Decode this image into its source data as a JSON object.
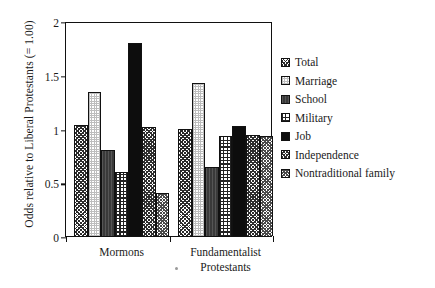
{
  "chart_data": {
    "type": "bar",
    "title": "",
    "xlabel": "",
    "ylabel": "Odds relative to Liberal Protestants (= 1.00)",
    "ylim": [
      0,
      2
    ],
    "yticks": [
      "0",
      "0.5",
      "1",
      "1.5",
      "2"
    ],
    "ytick_values": [
      0,
      0.5,
      1,
      1.5,
      2
    ],
    "grid": false,
    "legend_position": "right",
    "categories": [
      "Mormons",
      "Fundamentalist\nProtestants"
    ],
    "category_labels": [
      "Mormons",
      "Fundamentalist Protestants"
    ],
    "series": [
      {
        "name": "Total",
        "values": [
          1.03,
          1.0
        ],
        "swatch": "p-total"
      },
      {
        "name": "Marriage",
        "values": [
          1.34,
          1.42
        ],
        "swatch": "p-marriage"
      },
      {
        "name": "School",
        "values": [
          0.8,
          0.64
        ],
        "swatch": "p-school"
      },
      {
        "name": "Military",
        "values": [
          0.6,
          0.93
        ],
        "swatch": "p-military"
      },
      {
        "name": "Job",
        "values": [
          1.8,
          1.02
        ],
        "swatch": "p-job"
      },
      {
        "name": "Independence",
        "values": [
          1.01,
          0.94
        ],
        "swatch": "p-independence"
      },
      {
        "name": "Nontraditional family",
        "values": [
          0.4,
          0.93
        ],
        "swatch": "p-nontrad"
      }
    ]
  },
  "legend": {
    "items": [
      {
        "label": "Total",
        "swatch": "p-total"
      },
      {
        "label": "Marriage",
        "swatch": "p-marriage"
      },
      {
        "label": "School",
        "swatch": "p-school"
      },
      {
        "label": "Military",
        "swatch": "p-military"
      },
      {
        "label": "Job",
        "swatch": "p-job"
      },
      {
        "label": "Independence",
        "swatch": "p-independence"
      },
      {
        "label": "Nontraditional family",
        "swatch": "p-nontrad"
      }
    ]
  },
  "colors": {
    "axis": "#111111",
    "background": "#ffffff",
    "ink": "#1a1a1a"
  }
}
